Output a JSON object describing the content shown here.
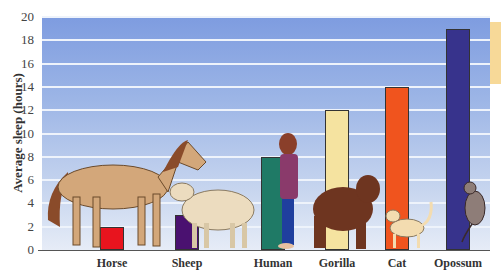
{
  "chart_data": {
    "type": "bar",
    "title": "",
    "xlabel": "",
    "ylabel": "Average sleep (hours)",
    "ylim": [
      0,
      20
    ],
    "yticks": [
      0,
      2,
      4,
      6,
      8,
      10,
      12,
      14,
      16,
      18,
      20
    ],
    "grid": true,
    "legend": null,
    "categories": [
      "Horse",
      "Sheep",
      "Human",
      "Gorilla",
      "Cat",
      "Opossum"
    ],
    "values": [
      2,
      3,
      8,
      12,
      14,
      19
    ],
    "colors": [
      "#e8141e",
      "#4a1170",
      "#1f7a66",
      "#f5e3a0",
      "#f0541e",
      "#37338c"
    ],
    "illustrations": [
      "horse",
      "sheep",
      "human",
      "gorilla",
      "cat",
      "opossum"
    ]
  }
}
